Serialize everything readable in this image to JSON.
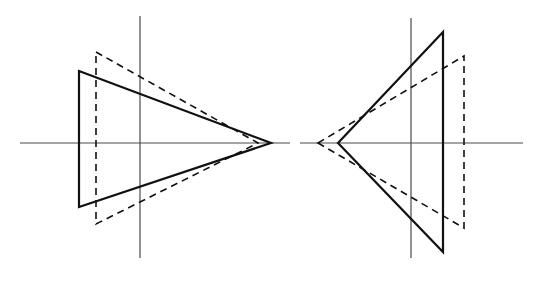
{
  "figure": {
    "title": "",
    "canvas": {
      "width": 545,
      "height": 282,
      "background": "#ffffff"
    },
    "stroke": {
      "solid_color": "#111111",
      "dashed_color": "#111111",
      "axis_color": "#4a4a4a",
      "solid_width": 2.2,
      "dashed_width": 1.6,
      "axis_width": 1.2,
      "dash_pattern": "7,5"
    },
    "panels": [
      {
        "name": "left-panel",
        "label": "left-figure",
        "axes": {
          "horizontal": {
            "x1": 20,
            "y1": 143,
            "x2": 290,
            "y2": 143
          },
          "vertical": {
            "x1": 140,
            "y1": 16,
            "x2": 140,
            "y2": 258
          }
        },
        "shapes": [
          {
            "name": "solid-triangle",
            "style": "solid",
            "points": "79,71 271,143 79,207"
          },
          {
            "name": "dashed-triangle",
            "style": "dashed",
            "points": "96,52 258,143 96,224"
          }
        ]
      },
      {
        "name": "right-panel",
        "label": "right-figure",
        "axes": {
          "horizontal": {
            "x1": 300,
            "y1": 143,
            "x2": 523,
            "y2": 143
          },
          "vertical": {
            "x1": 411,
            "y1": 18,
            "x2": 411,
            "y2": 258
          }
        },
        "shapes": [
          {
            "name": "solid-triangle",
            "style": "solid",
            "points": "338,143 443,32 443,252"
          },
          {
            "name": "dashed-triangle",
            "style": "dashed",
            "points": "318,143 464,56 464,228"
          }
        ]
      }
    ]
  }
}
